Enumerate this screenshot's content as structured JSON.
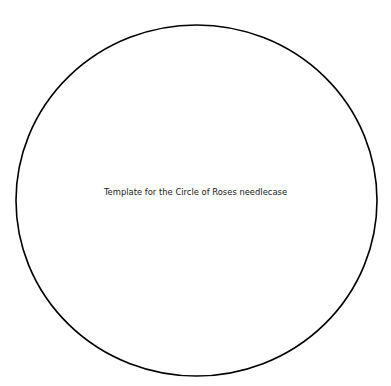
{
  "template": {
    "caption": "Template for the Circle of Roses needlecase",
    "shape": "circle-outline",
    "stroke_color": "#000000",
    "background_color": "#ffffff"
  }
}
